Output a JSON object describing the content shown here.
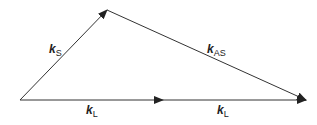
{
  "diagram": {
    "vectors": [
      {
        "id": "kS",
        "symbol": "k",
        "subscript": "S",
        "from": [
          20,
          100
        ],
        "to": [
          107,
          10
        ]
      },
      {
        "id": "kAS",
        "symbol": "k",
        "subscript": "AS",
        "from": [
          107,
          10
        ],
        "to": [
          306,
          100
        ]
      },
      {
        "id": "kL1",
        "symbol": "k",
        "subscript": "L",
        "from": [
          20,
          100
        ],
        "to": [
          163,
          100
        ]
      },
      {
        "id": "kL2",
        "symbol": "k",
        "subscript": "L",
        "from": [
          163,
          100
        ],
        "to": [
          306,
          100
        ]
      }
    ],
    "labels": {
      "kS": {
        "symbol": "k",
        "sub": "S"
      },
      "kAS": {
        "symbol": "k",
        "sub": "AS"
      },
      "kL_left": {
        "symbol": "k",
        "sub": "L"
      },
      "kL_right": {
        "symbol": "k",
        "sub": "L"
      }
    },
    "line_color": "#333333"
  }
}
